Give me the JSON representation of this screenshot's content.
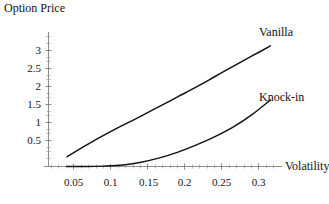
{
  "figure": {
    "title": "Option Price",
    "background_color": "#ffffff",
    "line_color": "#111111",
    "axis_color": "#6e6e6e"
  },
  "chart_data": {
    "type": "line",
    "title": "Option Price",
    "subtitle": "",
    "xlabel": "Volatility",
    "ylabel": "Option Price",
    "xlim": [
      0.0,
      0.315
    ],
    "ylim": [
      0.0,
      3.45
    ],
    "grid": false,
    "legend_position": "right-of-curve-ends",
    "x_ticks": [
      0.05,
      0.1,
      0.15,
      0.2,
      0.25,
      0.3
    ],
    "x_tick_labels": [
      "0.05",
      "0.1",
      "0.15",
      "0.2",
      "0.25",
      "0.3"
    ],
    "y_ticks": [
      0.5,
      1,
      1.5,
      2,
      2.5,
      3
    ],
    "y_tick_labels": [
      "0.5",
      "1",
      "1.5",
      "2",
      "2.5",
      "3"
    ],
    "x": [
      0.025,
      0.05,
      0.075,
      0.1,
      0.125,
      0.15,
      0.175,
      0.2,
      0.225,
      0.25,
      0.275,
      0.3
    ],
    "series": [
      {
        "name": "Vanilla",
        "label": "Vanilla",
        "color": "#111111",
        "values": [
          0.27,
          0.58,
          0.87,
          1.14,
          1.4,
          1.67,
          1.94,
          2.21,
          2.5,
          2.79,
          3.07,
          3.35
        ]
      },
      {
        "name": "Knock-in",
        "label": "Knock-in",
        "color": "#111111",
        "values": [
          0.0,
          0.0,
          0.01,
          0.04,
          0.12,
          0.24,
          0.4,
          0.6,
          0.83,
          1.1,
          1.44,
          1.85
        ]
      }
    ],
    "annotations": [
      {
        "text": "Vanilla",
        "x": 0.307,
        "y": 3.45
      },
      {
        "text": "Knock-in",
        "x": 0.307,
        "y": 1.98
      }
    ]
  }
}
